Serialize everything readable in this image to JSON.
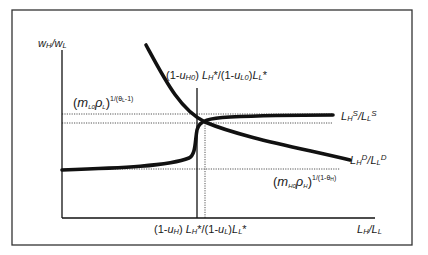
{
  "diagram": {
    "type": "supply-demand relative labor market",
    "y_axis_label": {
      "main": "w",
      "sub1": "H",
      "sep": "/w",
      "sub2": "L"
    },
    "x_axis_label": {
      "main": "L",
      "sub1": "H",
      "sep": "/L",
      "sub2": "L"
    },
    "supply_label": {
      "a": "L",
      "a_sub": "H",
      "a_sup": "S",
      "sep": "/L",
      "b_sub": "L",
      "b_sup": "S"
    },
    "demand_label": {
      "a": "L",
      "a_sub": "H",
      "a_sup": "D",
      "sep": "/L",
      "b_sub": "L",
      "b_sup": "D"
    },
    "top_vertical_label": {
      "p1": "(1-",
      "u": "u",
      "u_sub": "H0",
      "p2": ") ",
      "L": "L",
      "L_sub": "H",
      "p3": "*/(1-",
      "u2": "u",
      "u2_sub": "L0",
      "p4": ")",
      "L2": "L",
      "L2_sub": "L",
      "p5": "*"
    },
    "bottom_vertical_label": {
      "p1": "(1-",
      "u": "u",
      "u_sub": "H",
      "p2": ") ",
      "L": "L",
      "L_sub": "H",
      "p3": "*/(1-",
      "u2": "u",
      "u2_sub": "L",
      "p4": ")",
      "L2": "L",
      "L2_sub": "L",
      "p5": "*"
    },
    "upper_bound_label": {
      "open": "(",
      "m": "m",
      "m_sub": "L0",
      "rho": "ρ",
      "rho_sub": "L",
      "close": ")",
      "exp": "1/(θ",
      "exp_sub": "L",
      "exp_end": "-1)"
    },
    "lower_bound_label": {
      "open": "(",
      "m": "m",
      "m_sub": "H0",
      "rho": "ρ",
      "rho_sub": "H",
      "close": ")",
      "exp": "1/(1-θ",
      "exp_sub": "H",
      "exp_end": ")"
    },
    "colors": {
      "line": "#111111",
      "frame": "#333333",
      "dotted": "#555555",
      "background": "#ffffff"
    }
  }
}
